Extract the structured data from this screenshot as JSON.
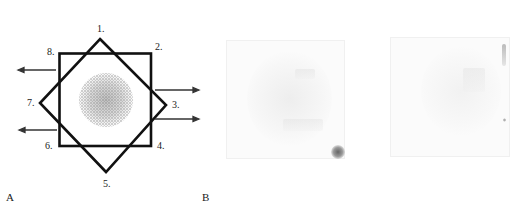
{
  "figure": {
    "panels": [
      {
        "id": "A",
        "label": "A",
        "type": "schematic",
        "description": "Square overlaid with a 45-degree rotated square (eight-point star) around a stippled circular sample",
        "point_labels": [
          "1.",
          "2.",
          "3.",
          "4.",
          "5.",
          "6.",
          "7.",
          "8."
        ],
        "arrows": {
          "left": 2,
          "right": 2
        }
      },
      {
        "id": "B",
        "label": "B",
        "type": "photographs",
        "images": [
          {
            "name": "photo-left",
            "note": "faint square sample with dark spot at lower-right corner"
          },
          {
            "name": "photo-right",
            "note": "faint square sample"
          }
        ]
      }
    ],
    "colors": {
      "line": "#111111",
      "arrow": "#333333",
      "stipple": "#555555",
      "background": "#ffffff"
    }
  }
}
